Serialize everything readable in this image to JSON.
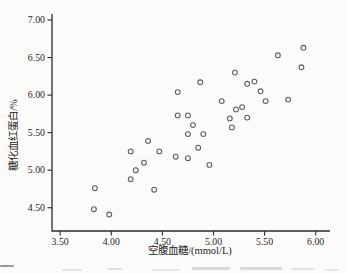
{
  "figure": {
    "background": "#fbfbf9"
  },
  "chart_data": {
    "type": "scatter",
    "title": "",
    "xlabel": "空腹血糖/(mmol/L)",
    "ylabel": "糖化血红蛋白/%",
    "xlim": [
      3.42,
      6.14
    ],
    "ylim": [
      4.19,
      7.08
    ],
    "x_ticks": [
      3.5,
      4.0,
      4.5,
      5.0,
      5.5,
      6.0
    ],
    "x_tick_labels": [
      "3.50",
      "4.00",
      "4.50",
      "5.00",
      "5.50",
      "6.00"
    ],
    "y_ticks": [
      4.5,
      5.0,
      5.5,
      6.0,
      6.5,
      7.0
    ],
    "y_tick_labels": [
      "4.50",
      "5.00",
      "5.50",
      "6.00",
      "6.50",
      "7.00"
    ],
    "grid": false,
    "legend": null,
    "axis_color": "#2b2b2b",
    "marker": {
      "shape": "open-circle",
      "radius_px": 2.4,
      "stroke": "#5f5f5f"
    },
    "points": [
      [
        5.88,
        6.63
      ],
      [
        5.63,
        6.53
      ],
      [
        5.86,
        6.37
      ],
      [
        5.21,
        6.3
      ],
      [
        5.4,
        6.18
      ],
      [
        5.33,
        6.15
      ],
      [
        4.87,
        6.17
      ],
      [
        4.65,
        6.04
      ],
      [
        5.46,
        6.05
      ],
      [
        5.73,
        5.94
      ],
      [
        5.51,
        5.92
      ],
      [
        5.08,
        5.92
      ],
      [
        5.28,
        5.84
      ],
      [
        5.22,
        5.81
      ],
      [
        4.65,
        5.73
      ],
      [
        4.75,
        5.73
      ],
      [
        5.16,
        5.69
      ],
      [
        5.33,
        5.7
      ],
      [
        5.18,
        5.57
      ],
      [
        4.8,
        5.6
      ],
      [
        4.75,
        5.48
      ],
      [
        4.9,
        5.48
      ],
      [
        4.36,
        5.39
      ],
      [
        4.85,
        5.3
      ],
      [
        4.47,
        5.25
      ],
      [
        4.19,
        5.25
      ],
      [
        4.63,
        5.18
      ],
      [
        4.75,
        5.16
      ],
      [
        4.96,
        5.07
      ],
      [
        4.32,
        5.1
      ],
      [
        4.24,
        5.0
      ],
      [
        4.19,
        4.88
      ],
      [
        3.84,
        4.76
      ],
      [
        4.42,
        4.74
      ],
      [
        3.83,
        4.48
      ],
      [
        3.98,
        4.41
      ]
    ]
  }
}
